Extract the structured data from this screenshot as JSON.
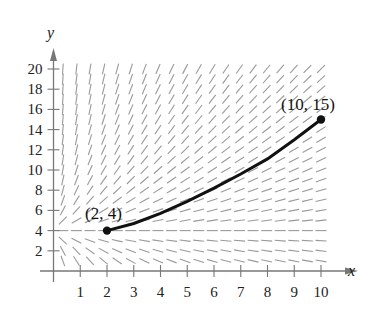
{
  "chart_data": {
    "type": "line",
    "title": "",
    "xlabel": "x",
    "ylabel": "y",
    "xlim": [
      0,
      10
    ],
    "ylim": [
      0,
      20
    ],
    "x_ticks": [
      1,
      2,
      3,
      4,
      5,
      6,
      7,
      8,
      9,
      10
    ],
    "y_ticks": [
      2,
      4,
      6,
      8,
      10,
      12,
      14,
      16,
      18,
      20
    ],
    "grid": false,
    "legend": null,
    "slope_field": {
      "description": "Slope field with steep segments at upper-left, flattening toward lower-right; near-horizontal along y≈4",
      "x_range": [
        0.35,
        10
      ],
      "y_range": [
        1,
        20
      ],
      "nx": 20,
      "ny": 20
    },
    "series": [
      {
        "name": "particular solution",
        "x": [
          2,
          3,
          4,
          5,
          6,
          7,
          8,
          9,
          10
        ],
        "y": [
          4,
          4.7,
          5.7,
          6.9,
          8.2,
          9.6,
          11.1,
          13.0,
          15.0
        ],
        "color": "#111111"
      }
    ],
    "annotations": [
      {
        "text": "(2, 4)",
        "x": 2,
        "y": 4
      },
      {
        "text": "(10, 15)",
        "x": 10,
        "y": 15
      }
    ]
  },
  "colors": {
    "axis": "#777777",
    "field": "#9a9a9a",
    "curve": "#111111"
  }
}
